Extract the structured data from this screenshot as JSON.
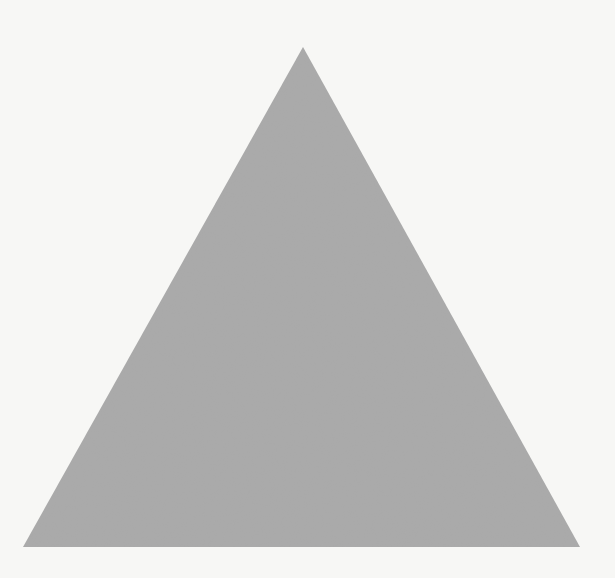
{
  "figure": {
    "shape": "equilateral-triangle",
    "orientation": "pointing-up",
    "fill_color": "#a9a9a9",
    "background_color": "#f7f7f5",
    "vertices": {
      "apex": [
        303,
        47
      ],
      "bottom_left": [
        23,
        547
      ],
      "bottom_right": [
        580,
        547
      ]
    }
  }
}
